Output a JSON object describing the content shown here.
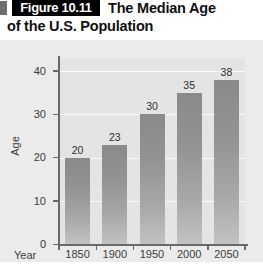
{
  "header": {
    "figure_badge": "Figure 10.11",
    "title_line1": "The Median Age",
    "title_line2": "of the U.S. Population"
  },
  "chart_data": {
    "type": "bar",
    "title": "The Median Age of the U.S. Population",
    "xlabel": "Year",
    "ylabel": "Age",
    "categories": [
      "1850",
      "1900",
      "1950",
      "2000",
      "2050"
    ],
    "values": [
      20,
      23,
      30,
      35,
      38
    ],
    "value_labels": [
      "20",
      "23",
      "30",
      "35",
      "38"
    ],
    "yticks": [
      "0",
      "10",
      "20",
      "30",
      "40"
    ],
    "ylim": [
      0,
      43
    ],
    "grid": true,
    "legend": "none",
    "colors": {
      "bar_top": "#8a8a8a",
      "bar_bottom": "#c2c2c2",
      "plot_background": "#e4e4e4",
      "figure_background": "#ebebeb",
      "gridline": "#fbfbfb",
      "axis": "#6a6a6a",
      "badge_background": "#000000",
      "badge_text": "#ffffff",
      "title_text": "#111111"
    }
  }
}
